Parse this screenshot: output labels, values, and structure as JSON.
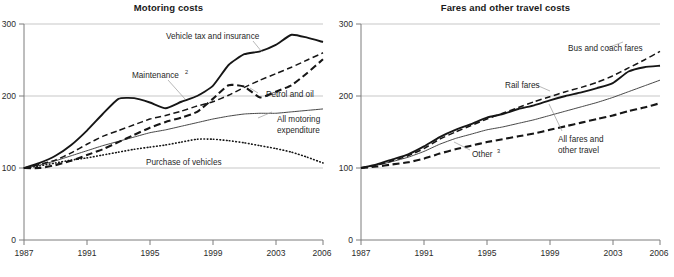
{
  "figure": {
    "width": 674,
    "height": 277,
    "background": "#ffffff",
    "line_color": "#161616"
  },
  "chart_data": [
    {
      "type": "line",
      "title": "Motoring costs",
      "xlabel": "",
      "ylabel": "",
      "xlim": [
        1987,
        2006
      ],
      "ylim": [
        0,
        300
      ],
      "x_ticks": [
        "1987",
        "1991",
        "1995",
        "1999",
        "2003",
        "2006"
      ],
      "y_ticks": [
        "0",
        "100",
        "200",
        "300"
      ],
      "grid": true,
      "legend_position": "inline-annotations",
      "x": [
        1987,
        1988,
        1989,
        1990,
        1991,
        1992,
        1993,
        1994,
        1995,
        1996,
        1997,
        1998,
        1999,
        2000,
        2001,
        2002,
        2003,
        2004,
        2005,
        2006
      ],
      "series": [
        {
          "name": "Vehicle tax and insurance",
          "style": "solid-thick",
          "values": [
            100,
            107,
            117,
            132,
            152,
            175,
            196,
            197,
            191,
            183,
            192,
            200,
            214,
            243,
            258,
            262,
            271,
            285,
            281,
            275
          ]
        },
        {
          "name": "Maintenance",
          "superscript": "2",
          "style": "dashed-medium",
          "values": [
            100,
            105,
            111,
            121,
            133,
            144,
            152,
            160,
            168,
            173,
            179,
            186,
            192,
            201,
            212,
            222,
            231,
            240,
            250,
            260
          ]
        },
        {
          "name": "Petrol and oil",
          "style": "dashed-heavy",
          "values": [
            100,
            100,
            104,
            110,
            118,
            126,
            136,
            146,
            156,
            164,
            170,
            178,
            196,
            215,
            213,
            198,
            206,
            215,
            232,
            251
          ]
        },
        {
          "name": "All motoring expenditure",
          "style": "solid-thin",
          "values": [
            100,
            104,
            110,
            117,
            124,
            131,
            137,
            143,
            149,
            153,
            158,
            163,
            168,
            172,
            175,
            176,
            176,
            178,
            180,
            182
          ]
        },
        {
          "name": "Purchase of vehicles",
          "style": "dotted",
          "values": [
            100,
            103,
            107,
            111,
            114,
            118,
            122,
            126,
            129,
            132,
            136,
            140,
            140,
            138,
            135,
            131,
            127,
            122,
            115,
            107
          ]
        }
      ]
    },
    {
      "type": "line",
      "title": "Fares and other travel costs",
      "xlabel": "",
      "ylabel": "",
      "xlim": [
        1987,
        2006
      ],
      "ylim": [
        0,
        300
      ],
      "x_ticks": [
        "1987",
        "1991",
        "1995",
        "1999",
        "2003",
        "2006"
      ],
      "y_ticks": [
        "0",
        "100",
        "200",
        "300"
      ],
      "grid": true,
      "legend_position": "inline-annotations",
      "x": [
        1987,
        1988,
        1989,
        1990,
        1991,
        1992,
        1993,
        1994,
        1995,
        1996,
        1997,
        1998,
        1999,
        2000,
        2001,
        2002,
        2003,
        2004,
        2005,
        2006
      ],
      "series": [
        {
          "name": "Bus and coach fares",
          "style": "dashed-medium",
          "values": [
            100,
            104,
            110,
            117,
            127,
            140,
            150,
            159,
            168,
            176,
            184,
            192,
            199,
            206,
            212,
            219,
            228,
            239,
            250,
            262
          ]
        },
        {
          "name": "Rail fares",
          "style": "solid-thick",
          "values": [
            100,
            105,
            112,
            119,
            130,
            143,
            153,
            161,
            170,
            175,
            182,
            187,
            194,
            200,
            205,
            211,
            218,
            234,
            240,
            242
          ]
        },
        {
          "name": "All fares and other travel",
          "style": "solid-thin",
          "values": [
            100,
            104,
            109,
            115,
            123,
            133,
            141,
            147,
            153,
            157,
            162,
            167,
            173,
            179,
            185,
            191,
            198,
            206,
            214,
            222
          ]
        },
        {
          "name": "Other",
          "superscript": "3",
          "style": "dashed-heavy",
          "values": [
            100,
            102,
            105,
            108,
            113,
            120,
            126,
            131,
            136,
            140,
            144,
            148,
            153,
            158,
            163,
            168,
            173,
            179,
            184,
            190
          ]
        }
      ]
    }
  ],
  "annotations": {
    "left": {
      "vehicle_tax": "Vehicle tax and insurance",
      "maintenance": "Maintenance",
      "maintenance_sup": "2",
      "petrol": "Petrol and oil",
      "all_motoring_1": "All motoring",
      "all_motoring_2": "expenditure",
      "purchase": "Purchase of vehicles"
    },
    "right": {
      "bus": "Bus and coach fares",
      "rail": "Rail fares",
      "all_fares_1": "All fares and",
      "all_fares_2": "other travel",
      "other": "Other",
      "other_sup": "3"
    }
  }
}
